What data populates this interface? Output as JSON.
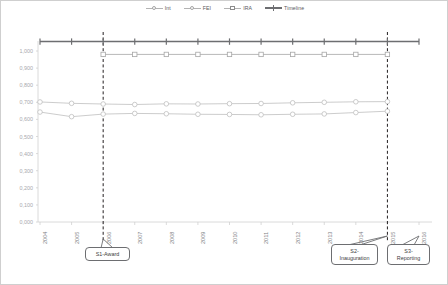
{
  "chart_data": {
    "type": "line",
    "title": "",
    "xlabel": "",
    "ylabel": "",
    "categories": [
      "2004",
      "2005",
      "2006",
      "2007",
      "2008",
      "2009",
      "2010",
      "2011",
      "2012",
      "2013",
      "2014",
      "2015",
      "2016"
    ],
    "ylim": [
      0.0,
      1.0
    ],
    "ytick_labels": [
      "1,000",
      "0,900",
      "0,800",
      "0,700",
      "0,600",
      "0,500",
      "0,400",
      "0,300",
      "0,200",
      "0,100",
      "0,000"
    ],
    "ytick_values": [
      1.0,
      0.9,
      0.8,
      0.7,
      0.6,
      0.5,
      0.4,
      0.3,
      0.2,
      0.1,
      0.0
    ],
    "grid": false,
    "legend_position": "top-center",
    "series": [
      {
        "name": "Int",
        "marker": "circle",
        "color": "#bfbfbf",
        "x": [
          "2004",
          "2005",
          "2006",
          "2007",
          "2008",
          "2009",
          "2010",
          "2011",
          "2012",
          "2013",
          "2014",
          "2015"
        ],
        "values": [
          0.702,
          0.694,
          0.69,
          0.687,
          0.691,
          0.69,
          0.692,
          0.693,
          0.697,
          0.7,
          0.703,
          0.704
        ]
      },
      {
        "name": "FEI",
        "marker": "circle",
        "color": "#bfbfbf",
        "x": [
          "2004",
          "2005",
          "2006",
          "2007",
          "2008",
          "2009",
          "2010",
          "2011",
          "2012",
          "2013",
          "2014",
          "2015"
        ],
        "values": [
          0.643,
          0.616,
          0.631,
          0.635,
          0.633,
          0.63,
          0.629,
          0.627,
          0.63,
          0.632,
          0.64,
          0.648
        ]
      },
      {
        "name": "IRA",
        "marker": "square",
        "color": "#a6a6a6",
        "x": [
          "2006",
          "2007",
          "2008",
          "2009",
          "2010",
          "2011",
          "2012",
          "2013",
          "2014",
          "2015"
        ],
        "values": [
          0.98,
          0.98,
          0.98,
          0.98,
          0.98,
          0.98,
          0.98,
          0.98,
          0.98,
          0.98
        ]
      },
      {
        "name": "Timeline",
        "marker": "cross",
        "color": "#6d6e71",
        "x": [
          "2004",
          "2005",
          "2006",
          "2007",
          "2008",
          "2009",
          "2010",
          "2011",
          "2012",
          "2013",
          "2014",
          "2015",
          "2016"
        ],
        "values": [
          1.055,
          1.055,
          1.055,
          1.055,
          1.055,
          1.055,
          1.055,
          1.055,
          1.055,
          1.055,
          1.055,
          1.055,
          1.055
        ]
      }
    ],
    "annotations": [
      {
        "id": "S1",
        "label": "S1-Award",
        "at_year": "2006",
        "vline": true
      },
      {
        "id": "S2",
        "label": "S2-\nInauguration",
        "at_year": "2015",
        "vline": true
      },
      {
        "id": "S3",
        "label": "S3-\nReporting",
        "at_year": "2016",
        "vline": false
      }
    ]
  },
  "legend": {
    "items": [
      {
        "label": "Int"
      },
      {
        "label": "FEI"
      },
      {
        "label": "IRA"
      },
      {
        "label": "Timeline"
      }
    ]
  },
  "callouts": {
    "s1_line1": "S1-Award",
    "s1_line2": "",
    "s2_line1": "S2-",
    "s2_line2": "Inauguration",
    "s3_line1": "S3-",
    "s3_line2": "Reporting"
  },
  "colors": {
    "series_light": "#bfbfbf",
    "series_mid": "#a6a6a6",
    "timeline": "#6d6e71",
    "axis": "#d0d0d0",
    "label": "#a7a9ac",
    "xlabel": "#808285",
    "callout_border": "#6d6e71"
  }
}
